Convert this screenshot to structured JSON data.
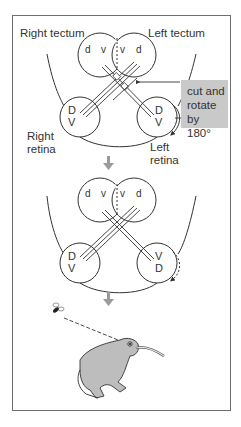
{
  "labels": {
    "right_tectum": "Right tectum",
    "left_tectum": "Left tectum",
    "right_retina_1": "Right",
    "right_retina_2": "retina",
    "left_retina_1": "Left",
    "left_retina_2": "retina",
    "cut_line1": "cut and",
    "cut_line2": "rotate by",
    "cut_line3": "180°"
  },
  "top_panel": {
    "tectum_letters": [
      "d",
      "v",
      "v",
      "d"
    ],
    "right_retina_letters": [
      "D",
      "V"
    ],
    "left_retina_letters": [
      "D",
      "V"
    ]
  },
  "bottom_panel": {
    "tectum_letters": [
      "d",
      "v",
      "v",
      "d"
    ],
    "right_retina_letters": [
      "D",
      "V"
    ],
    "left_retina_letters": [
      "V",
      "D"
    ]
  },
  "colors": {
    "line": "#333333",
    "gray_box": "#c9c9c9",
    "arrow": "#9a9a9a",
    "frog": "#bdbdbd"
  }
}
